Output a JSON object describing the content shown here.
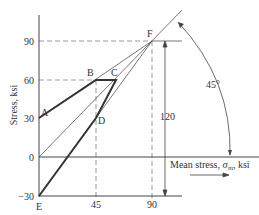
{
  "diagram": {
    "type": "modified-goodman-diagram",
    "xlabel": "Mean stress, σm, ksi",
    "xlabel_main": "Mean stress, σ",
    "xlabel_sub": "m",
    "xlabel_unit": ", ksi",
    "ylabel": "Stress, ksi",
    "x_ticks": [
      "45",
      "90"
    ],
    "y_ticks": [
      "90",
      "60",
      "30",
      "0",
      "−30"
    ],
    "points": {
      "A": {
        "label": "A",
        "x": 0,
        "y": 30
      },
      "B": {
        "label": "B",
        "x": 45,
        "y": 60
      },
      "C": {
        "label": "C",
        "x": 60,
        "y": 60
      },
      "D": {
        "label": "D",
        "x": 45,
        "y": 30
      },
      "E": {
        "label": "E",
        "x": 0,
        "y": -30
      },
      "F": {
        "label": "F",
        "x": 90,
        "y": 90
      }
    },
    "annotations": {
      "range": "120",
      "angle": "45°"
    }
  }
}
